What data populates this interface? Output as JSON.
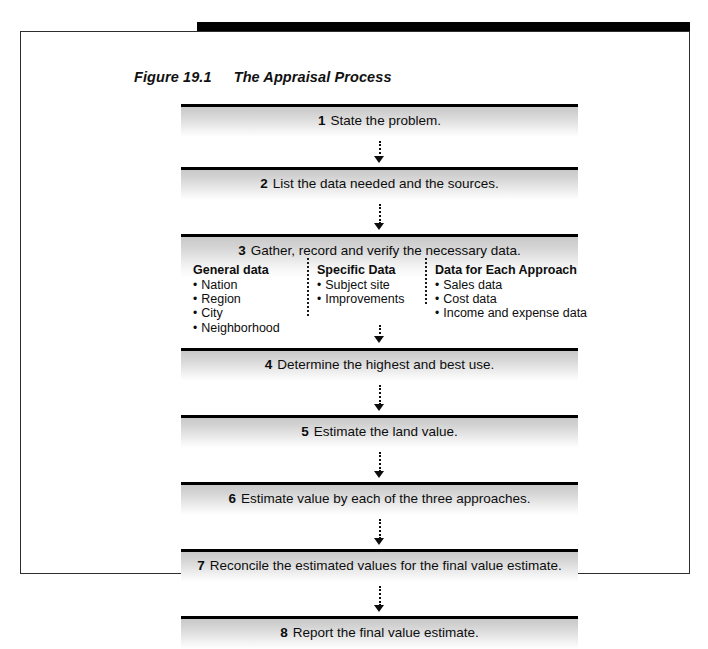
{
  "figure": {
    "number": "Figure 19.1",
    "title": "The Appraisal Process"
  },
  "steps": [
    {
      "num": "1",
      "text": "State the problem."
    },
    {
      "num": "2",
      "text": "List the data needed and the sources."
    },
    {
      "num": "3",
      "text": "Gather, record and verify the necessary data."
    },
    {
      "num": "4",
      "text": "Determine the highest and best use."
    },
    {
      "num": "5",
      "text": "Estimate the land value."
    },
    {
      "num": "6",
      "text": "Estimate value by each of the three approaches."
    },
    {
      "num": "7",
      "text": "Reconcile the estimated values for the final value estimate."
    },
    {
      "num": "8",
      "text": "Report the final value estimate."
    }
  ],
  "data_columns": [
    {
      "heading": "General data",
      "items": [
        "Nation",
        "Region",
        "City",
        "Neighborhood"
      ]
    },
    {
      "heading": "Specific Data",
      "items": [
        "Subject site",
        "Improvements"
      ]
    },
    {
      "heading": "Data for Each Approach",
      "items": [
        "Sales data",
        "Cost data",
        "Income and expense data"
      ]
    }
  ],
  "colors": {
    "rule": "#000000",
    "frame_border": "#2e2e2e",
    "box_fill_top": "#c9c9c9",
    "box_fill_bottom": "#ffffff",
    "text": "#0d0d0d"
  }
}
